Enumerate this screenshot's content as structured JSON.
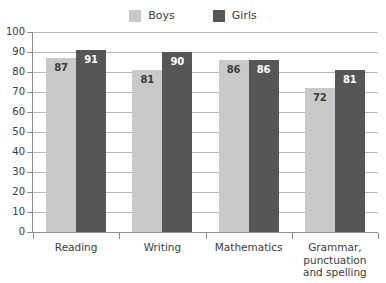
{
  "legend": {
    "entries": [
      {
        "label": "Boys",
        "color": "#c9c9c9",
        "swatch_name": "legend-swatch-boys"
      },
      {
        "label": "Girls",
        "color": "#565656",
        "swatch_name": "legend-swatch-girls"
      }
    ]
  },
  "chart_data": {
    "type": "bar",
    "title": "",
    "subtitle": "",
    "xlabel": "",
    "ylabel": "",
    "ylim": [
      0,
      100
    ],
    "yticks": [
      "0",
      "10",
      "20",
      "30",
      "40",
      "50",
      "60",
      "70",
      "80",
      "90",
      "100"
    ],
    "grid": true,
    "legend_position": "top-center",
    "categories": [
      "Reading",
      "Writing",
      "Mathematics",
      "Grammar, punctuation and spelling"
    ],
    "category_lines": [
      [
        "Reading"
      ],
      [
        "Writing"
      ],
      [
        "Mathematics"
      ],
      [
        "Grammar,",
        "punctuation",
        "and spelling"
      ]
    ],
    "series": [
      {
        "name": "Boys",
        "color": "#c9c9c9",
        "values": [
          87,
          81,
          86,
          72
        ]
      },
      {
        "name": "Girls",
        "color": "#565656",
        "values": [
          91,
          90,
          86,
          81
        ]
      }
    ]
  },
  "colors": {
    "background": "#ffffff",
    "gridline": "#b7b7b7",
    "axis": "#8d8d8d",
    "text": "#3b3b3b",
    "value_label_light_bar": "#3b3b3b",
    "value_label_dark_bar": "#ffffff"
  }
}
